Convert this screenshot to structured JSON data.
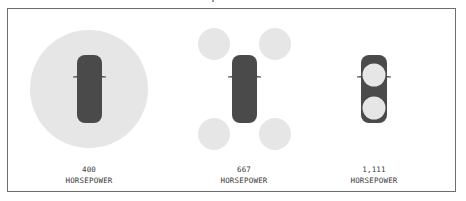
{
  "colors": {
    "car": "#4a4a4a",
    "circle": "#e6e6e6",
    "border": "#6e6e6e",
    "text": "#3a3a3a"
  },
  "panels": [
    {
      "value": "400",
      "unit": "HORSEPOWER",
      "circle_layout": "one large circle around car"
    },
    {
      "value": "667",
      "unit": "HORSEPOWER",
      "circle_layout": "four circles at corners"
    },
    {
      "value": "1,111",
      "unit": "HORSEPOWER",
      "circle_layout": "two small circles on car"
    }
  ]
}
